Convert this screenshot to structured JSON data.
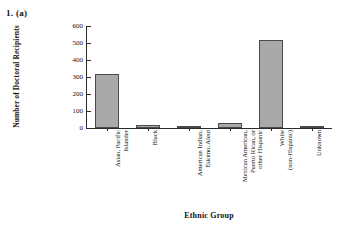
{
  "figure": {
    "problem_label": "1.  (a)"
  },
  "chart_data": {
    "type": "bar",
    "title": "",
    "xlabel": "Ethnic Group",
    "ylabel": "Number of Doctoral Recipients",
    "ylim": [
      0,
      600
    ],
    "yticks": [
      0,
      100,
      200,
      300,
      400,
      500,
      600
    ],
    "ytick_labels": [
      "0",
      "100",
      "200",
      "300",
      "400",
      "500",
      "600"
    ],
    "grid": false,
    "legend": "none",
    "bar_color": "#a9a9a9",
    "bar_edge_color": "#4a4a4a",
    "axis_color": "#2b2b2b",
    "categories": [
      "Asian, Pacific Islander",
      "Black",
      "American Indian, Eskimo, Aleut",
      "Mexican American, Puerto Rican, or other Hispanic",
      "White (non-Hispanic)",
      "Unknown"
    ],
    "category_lines": [
      [
        "Asian, Pacific",
        "Islander"
      ],
      [
        "Black"
      ],
      [
        "American Indian,",
        "Eskimo, Aleut"
      ],
      [
        "Mexican American,",
        "Puerto Rican, or",
        "other Hispanic"
      ],
      [
        "White",
        "(non-Hispanic)"
      ],
      [
        "Unknown"
      ]
    ],
    "values": [
      315,
      15,
      2,
      30,
      520,
      5
    ]
  }
}
